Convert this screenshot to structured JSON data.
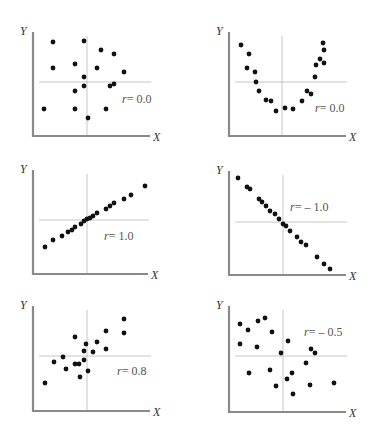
{
  "chart_data": [
    {
      "type": "scatter",
      "title": "",
      "xlabel": "X",
      "ylabel": "Y",
      "annotation": "r= 0.0",
      "frame": {
        "x0": 33,
        "y0": 136,
        "x1": 150,
        "yTop": 32,
        "cx": 87,
        "cy": 82
      },
      "label_pos": {
        "x": 122,
        "y": 103
      },
      "points": [
        [
          53,
          42
        ],
        [
          84,
          41
        ],
        [
          101,
          50
        ],
        [
          114,
          54
        ],
        [
          53,
          68
        ],
        [
          75,
          64
        ],
        [
          97,
          68
        ],
        [
          124,
          72
        ],
        [
          84,
          77
        ],
        [
          84,
          86
        ],
        [
          110,
          86
        ],
        [
          114,
          84
        ],
        [
          75,
          91
        ],
        [
          44,
          109
        ],
        [
          75,
          109
        ],
        [
          106,
          109
        ],
        [
          88,
          118
        ]
      ]
    },
    {
      "type": "scatter",
      "title": "",
      "xlabel": "X",
      "ylabel": "Y",
      "annotation": "r= 0.0",
      "frame": {
        "x0": 229,
        "y0": 136,
        "x1": 346,
        "yTop": 32,
        "cx": 282,
        "cy": 82
      },
      "label_pos": {
        "x": 315,
        "y": 112
      },
      "points": [
        [
          241,
          45
        ],
        [
          249,
          54
        ],
        [
          247,
          68
        ],
        [
          255,
          72
        ],
        [
          256,
          82
        ],
        [
          259,
          91
        ],
        [
          266,
          100
        ],
        [
          271,
          101
        ],
        [
          276,
          111
        ],
        [
          285,
          108
        ],
        [
          293,
          109
        ],
        [
          302,
          101
        ],
        [
          307,
          91
        ],
        [
          311,
          94
        ],
        [
          315,
          77
        ],
        [
          316,
          65
        ],
        [
          320,
          59
        ],
        [
          324,
          50
        ],
        [
          324,
          63
        ],
        [
          323,
          43
        ]
      ]
    },
    {
      "type": "scatter",
      "title": "",
      "xlabel": "X",
      "ylabel": "Y",
      "annotation": "r= 1.0",
      "frame": {
        "x0": 33,
        "y0": 274,
        "x1": 148,
        "yTop": 170,
        "cx": 87,
        "cy": 220
      },
      "label_pos": {
        "x": 104,
        "y": 240
      },
      "points": [
        [
          45,
          247
        ],
        [
          53,
          240
        ],
        [
          62,
          236
        ],
        [
          68,
          232
        ],
        [
          72,
          230
        ],
        [
          75,
          227
        ],
        [
          81,
          224
        ],
        [
          84,
          221
        ],
        [
          87,
          219
        ],
        [
          90,
          218
        ],
        [
          93,
          216
        ],
        [
          97,
          213
        ],
        [
          106,
          209
        ],
        [
          110,
          206
        ],
        [
          114,
          203
        ],
        [
          124,
          199
        ],
        [
          131,
          195
        ],
        [
          145,
          186
        ]
      ]
    },
    {
      "type": "scatter",
      "title": "",
      "xlabel": "X",
      "ylabel": "Y",
      "annotation": "r= – 1.0",
      "frame": {
        "x0": 229,
        "y0": 275,
        "x1": 346,
        "yTop": 171,
        "cx": 283,
        "cy": 222
      },
      "label_pos": {
        "x": 290,
        "y": 211
      },
      "points": [
        [
          238,
          178
        ],
        [
          247,
          187
        ],
        [
          250,
          189
        ],
        [
          259,
          199
        ],
        [
          262,
          202
        ],
        [
          266,
          206
        ],
        [
          270,
          211
        ],
        [
          275,
          214
        ],
        [
          279,
          219
        ],
        [
          283,
          224
        ],
        [
          286,
          226
        ],
        [
          290,
          231
        ],
        [
          297,
          237
        ],
        [
          301,
          242
        ],
        [
          306,
          245
        ],
        [
          317,
          257
        ],
        [
          324,
          264
        ],
        [
          330,
          269
        ]
      ]
    },
    {
      "type": "scatter",
      "title": "",
      "xlabel": "X",
      "ylabel": "Y",
      "annotation": "r= 0.8",
      "frame": {
        "x0": 33,
        "y0": 411,
        "x1": 150,
        "yTop": 306,
        "cx": 87,
        "cy": 356
      },
      "label_pos": {
        "x": 117,
        "y": 375
      },
      "points": [
        [
          45,
          383
        ],
        [
          54,
          362
        ],
        [
          63,
          357
        ],
        [
          66,
          369
        ],
        [
          75,
          337
        ],
        [
          75,
          364
        ],
        [
          79,
          364
        ],
        [
          80,
          377
        ],
        [
          84,
          360
        ],
        [
          84,
          351
        ],
        [
          86,
          344
        ],
        [
          88,
          371
        ],
        [
          93,
          352
        ],
        [
          97,
          342
        ],
        [
          106,
          331
        ],
        [
          106,
          349
        ],
        [
          124,
          319
        ],
        [
          124,
          333
        ]
      ]
    },
    {
      "type": "scatter",
      "title": "",
      "xlabel": "X",
      "ylabel": "Y",
      "annotation": "r= – 0.5",
      "frame": {
        "x0": 229,
        "y0": 412,
        "x1": 346,
        "yTop": 306,
        "cx": 283,
        "cy": 356
      },
      "label_pos": {
        "x": 304,
        "y": 336
      },
      "points": [
        [
          240,
          324
        ],
        [
          248,
          330
        ],
        [
          258,
          321
        ],
        [
          265,
          318
        ],
        [
          272,
          332
        ],
        [
          240,
          344
        ],
        [
          257,
          347
        ],
        [
          281,
          353
        ],
        [
          288,
          341
        ],
        [
          311,
          349
        ],
        [
          315,
          353
        ],
        [
          306,
          363
        ],
        [
          249,
          373
        ],
        [
          270,
          370
        ],
        [
          292,
          373
        ],
        [
          287,
          379
        ],
        [
          276,
          386
        ],
        [
          293,
          394
        ],
        [
          310,
          385
        ],
        [
          334,
          383
        ]
      ]
    }
  ],
  "labels": {
    "y": "Y",
    "x": "X",
    "r": [
      "r= 0.0",
      "r= 0.0",
      "r= 1.0",
      "r= – 1.0",
      "r= 0.8",
      "r= – 0.5"
    ]
  }
}
